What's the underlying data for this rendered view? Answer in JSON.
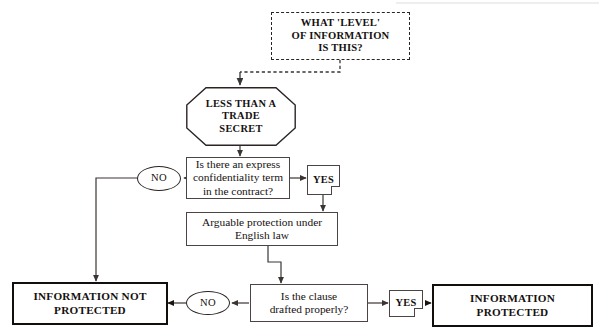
{
  "diagram": {
    "title_node": {
      "id": "level-of-information",
      "text": "WHAT 'LEVEL'\nOF INFORMATION\nIS THIS?",
      "shape": "dashed-rectangle"
    },
    "nodes": [
      {
        "id": "less-than-trade-secret",
        "text": "LESS THAN A\nTRADE\nSECRET",
        "shape": "octagon"
      },
      {
        "id": "express-confidentiality-term",
        "text": "Is there an express\nconfidentiality term\nin the contract?",
        "shape": "rectangle"
      },
      {
        "id": "arguable-protection",
        "text": "Arguable protection under\nEnglish law",
        "shape": "rectangle"
      },
      {
        "id": "clause-drafted-properly",
        "text": "Is the clause\ndrafted properly?",
        "shape": "rectangle"
      },
      {
        "id": "information-not-protected",
        "text": "INFORMATION NOT\nPROTECTED",
        "shape": "heavy-rectangle"
      },
      {
        "id": "information-protected",
        "text": "INFORMATION\nPROTECTED",
        "shape": "heavy-rectangle"
      }
    ],
    "decision_labels": {
      "no_1": "NO",
      "yes_1": "YES",
      "no_2": "NO",
      "yes_2": "YES"
    },
    "colors": {
      "ink": "#15110f",
      "line": "#4a4542",
      "heavy_border": "#110e0c",
      "background": "#ffffff"
    }
  }
}
